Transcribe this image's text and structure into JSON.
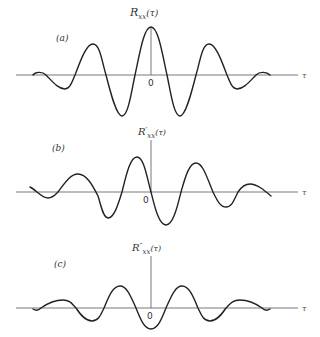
{
  "panels": [
    {
      "id": "a",
      "label": "(a)",
      "ylabel_main": "R",
      "ylabel_prime": "",
      "ylabel_sub": "xx",
      "ylabel_arg": "(τ)",
      "origin_label": "0",
      "xlabel": "τ"
    },
    {
      "id": "b",
      "label": "(b)",
      "ylabel_main": "R",
      "ylabel_prime": "′",
      "ylabel_sub": "xx",
      "ylabel_arg": "(τ)",
      "origin_label": "0",
      "xlabel": "τ"
    },
    {
      "id": "c",
      "label": "(c)",
      "ylabel_main": "R",
      "ylabel_prime": "″",
      "ylabel_sub": "xx",
      "ylabel_arg": "(τ)",
      "origin_label": "0",
      "xlabel": "τ"
    }
  ],
  "colors": {
    "curve": "#222222",
    "axis": "#555555",
    "background": "#ffffff"
  }
}
